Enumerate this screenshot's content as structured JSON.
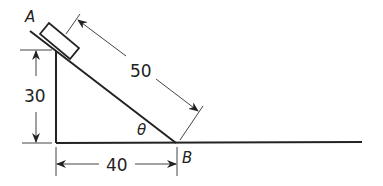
{
  "diagram": {
    "type": "inclined-plane",
    "labels": {
      "point_a": "A",
      "point_b": "B",
      "angle": "θ",
      "hypotenuse": "50",
      "height": "30",
      "base": "40"
    },
    "colors": {
      "line": "#222222",
      "background": "#ffffff"
    }
  }
}
